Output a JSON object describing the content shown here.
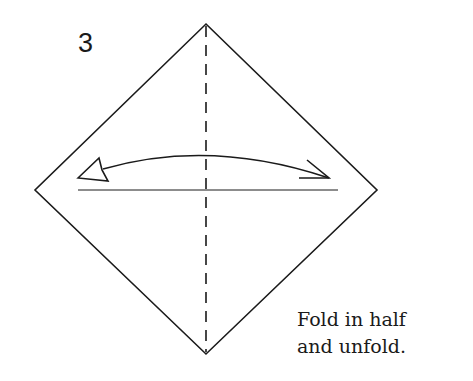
{
  "diagram": {
    "type": "origami-step",
    "step_number": "3",
    "instruction_lines": [
      "Fold in half",
      "and unfold."
    ],
    "paper": {
      "shape": "diamond",
      "vertices": {
        "top": [
          206,
          24
        ],
        "right": [
          377,
          190
        ],
        "bottom": [
          206,
          354
        ],
        "left": [
          35,
          190
        ]
      }
    },
    "fold_line": {
      "style": "dashed",
      "kind": "valley-fold",
      "from": [
        206,
        24
      ],
      "to": [
        206,
        354
      ]
    },
    "reference_line": {
      "from": [
        78,
        190
      ],
      "to": [
        338,
        190
      ]
    },
    "arrow": {
      "kind": "fold-and-unfold",
      "from": [
        329,
        178
      ],
      "to": [
        80,
        178
      ],
      "peak_y": 155
    },
    "colors": {
      "ink": "#1a1a1a",
      "background": "#ffffff"
    }
  }
}
